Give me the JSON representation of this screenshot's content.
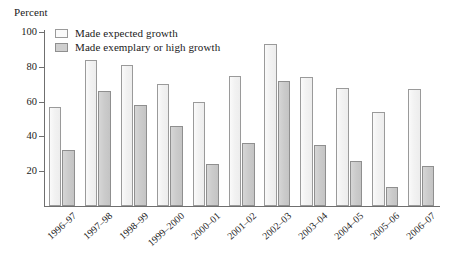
{
  "chart_data": {
    "type": "bar",
    "title": "",
    "subtitle": "",
    "xlabel": "",
    "ylabel": "Percent",
    "ylim": [
      0,
      100
    ],
    "yticks": [
      0,
      20,
      40,
      60,
      80,
      100
    ],
    "ytick_labels": [
      "",
      "20",
      "40",
      "60",
      "80",
      "100"
    ],
    "grid": false,
    "legend_position": "top-left",
    "categories": [
      "1996–97",
      "1997–98",
      "1998–99",
      "1999–2000",
      "2000–01",
      "2001–02",
      "2002–03",
      "2003–04",
      "2004–05",
      "2005–06",
      "2006–07"
    ],
    "series": [
      {
        "name": "Made expected growth",
        "color": "#f2f2f2",
        "values": [
          57,
          84,
          81,
          70,
          60,
          75,
          93,
          74,
          68,
          54,
          67
        ]
      },
      {
        "name": "Made exemplary or high growth",
        "color": "#cbcbcb",
        "values": [
          32,
          66,
          58,
          46,
          24,
          36,
          72,
          35,
          26,
          11,
          23
        ]
      }
    ]
  },
  "legend": {
    "items": [
      {
        "label": "Made expected growth",
        "swatch": "expected"
      },
      {
        "label": "Made exemplary or high growth",
        "swatch": "exemplary"
      }
    ]
  }
}
